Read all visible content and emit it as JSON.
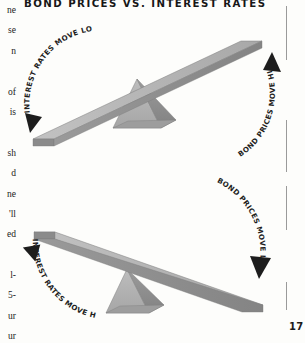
{
  "page": {
    "title": "BOND PRICES VS. INTEREST RATES",
    "page_number": "17",
    "background_color": "#fdfdfb",
    "text_color": "#1a1a1a",
    "rule_color": "#9a9a9a"
  },
  "body_column_fragments": [
    "ne",
    "se",
    "n",
    "of",
    "is",
    "sh",
    "d",
    "ne",
    "'ll",
    "ed",
    "l-",
    "5-",
    "ur",
    "ur"
  ],
  "diagrams": [
    {
      "id": "seesaw-top",
      "description": "Seesaw tilted with left end down and right end up",
      "left_label": "INTEREST RATES MOVE LOWER",
      "left_arrow": "arrow-down",
      "right_label": "BOND PRICES MOVE HIGHER",
      "right_arrow": "arrow-up",
      "plank_top_color": "#b9b9b9",
      "plank_side_color": "#8f8f8f",
      "fulcrum_light_color": "#b2b2b2",
      "fulcrum_dark_color": "#8b8b8b"
    },
    {
      "id": "seesaw-bottom",
      "description": "Seesaw tilted with left end up and right end down",
      "left_label": "INTEREST RATES MOVE HIGHER",
      "left_arrow": "arrow-up",
      "right_label": "BOND PRICES MOVE LOWER",
      "right_arrow": "arrow-down",
      "plank_top_color": "#b9b9b9",
      "plank_side_color": "#8f8f8f",
      "fulcrum_light_color": "#b2b2b2",
      "fulcrum_dark_color": "#8b8b8b"
    }
  ]
}
